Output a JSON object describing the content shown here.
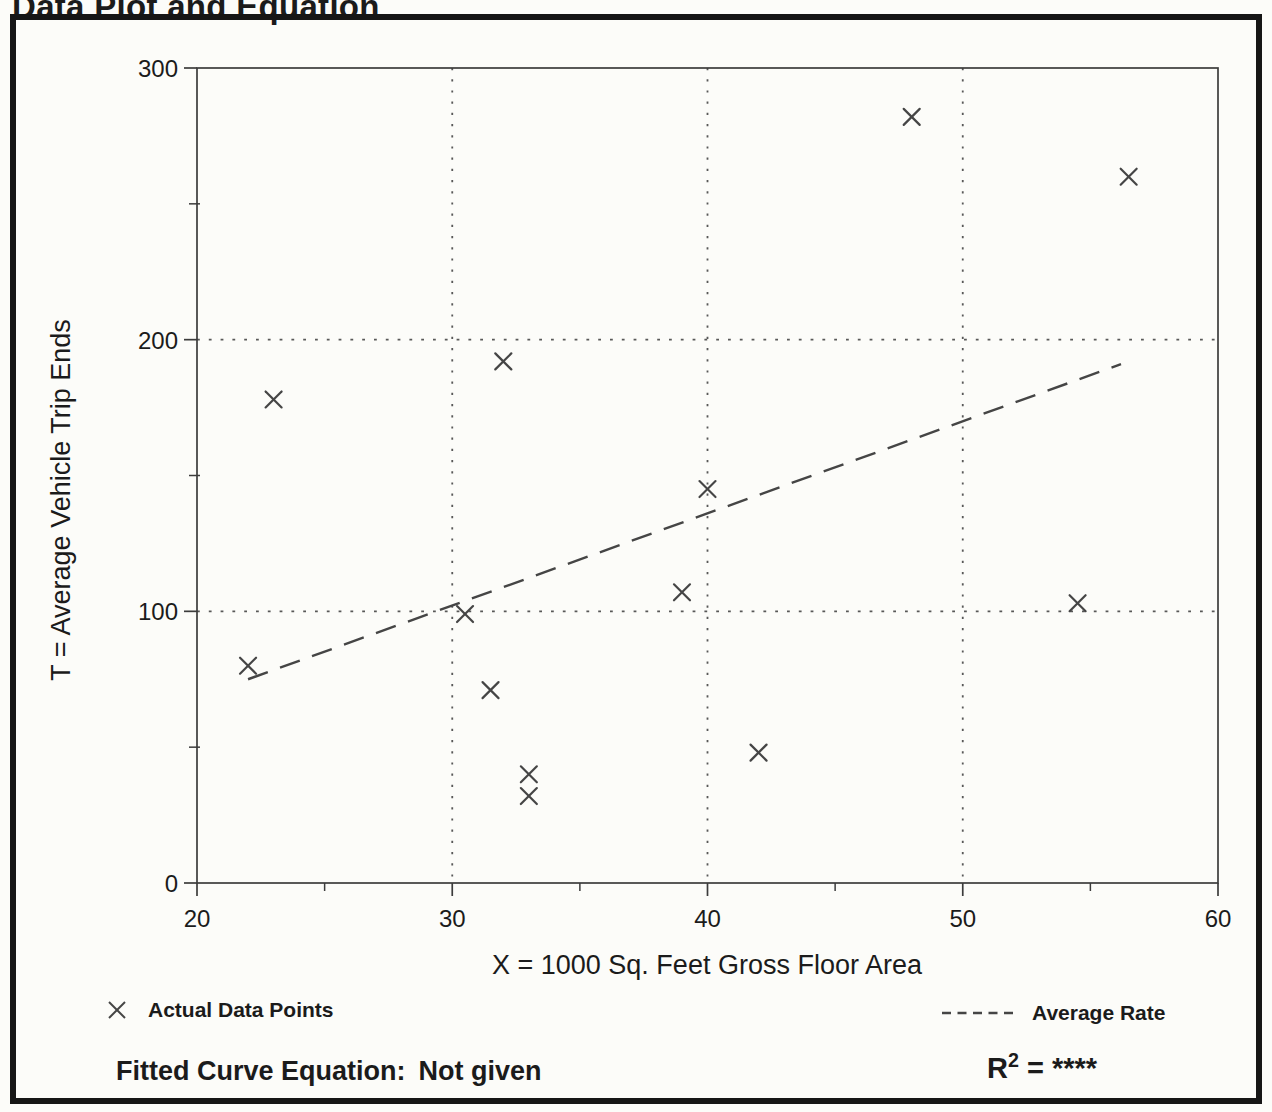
{
  "page": {
    "title": "Data Plot and Equation"
  },
  "colors": {
    "ink": "#1b1b1b",
    "chart_line": "#454545",
    "paper": "#fcfcf9"
  },
  "chart_data": {
    "type": "scatter",
    "title": "Data Plot and Equation",
    "xlabel": "X = 1000 Sq. Feet Gross Floor Area",
    "ylabel": "T = Average Vehicle Trip Ends",
    "xlim": [
      20,
      60
    ],
    "ylim": [
      0,
      300
    ],
    "x_major_ticks": [
      20,
      30,
      40,
      50,
      60
    ],
    "x_minor_ticks": [
      25,
      35,
      45,
      55
    ],
    "y_major_ticks": [
      0,
      100,
      200,
      300
    ],
    "y_minor_ticks": [
      50,
      150,
      250
    ],
    "x_gridlines": [
      30,
      40,
      50
    ],
    "y_gridlines": [
      100,
      200
    ],
    "grid_style": "dotted",
    "legend_position": "bottom",
    "series": [
      {
        "name": "Actual Data Points",
        "type": "scatter",
        "marker": "x",
        "points": [
          [
            22,
            80
          ],
          [
            23,
            178
          ],
          [
            30.5,
            99
          ],
          [
            31.5,
            71
          ],
          [
            32,
            192
          ],
          [
            33,
            40
          ],
          [
            33,
            32
          ],
          [
            39,
            107
          ],
          [
            40,
            145
          ],
          [
            42,
            48
          ],
          [
            48,
            282
          ],
          [
            54.5,
            103
          ],
          [
            56.5,
            260
          ]
        ]
      },
      {
        "name": "Average Rate",
        "type": "line",
        "style": "dashed",
        "points": [
          [
            22,
            75
          ],
          [
            56.2,
            191
          ]
        ]
      }
    ],
    "legend": [
      {
        "icon": "x-marker",
        "label": "Actual Data Points"
      },
      {
        "icon": "dashed-line",
        "label": "Average Rate"
      }
    ],
    "annotations": {
      "fitted_label": "Fitted Curve Equation:",
      "fitted_value": "Not given",
      "r_base": "R",
      "r_sup": "2",
      "r_value": "= ****"
    }
  }
}
